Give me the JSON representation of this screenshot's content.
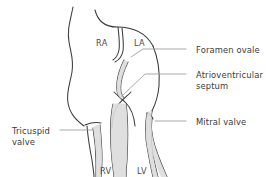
{
  "figure": {
    "kind": "anatomical-line-diagram",
    "background_color": "#ffffff",
    "stroke_color": "#3c3c3c",
    "leader_color": "#9a9a9a",
    "fill_color": "#dcdcdc",
    "text_color": "#3a3a3a"
  },
  "chambers": [
    {
      "id": "ra",
      "label": "RA",
      "meaning": "right atrium",
      "x": 96,
      "y": 38
    },
    {
      "id": "la",
      "label": "LA",
      "meaning": "left atrium",
      "x": 134,
      "y": 38
    },
    {
      "id": "rv",
      "label": "RV",
      "meaning": "right ventricle",
      "x": 100,
      "y": 166
    },
    {
      "id": "lv",
      "label": "LV",
      "meaning": "left ventricle",
      "x": 137,
      "y": 166
    }
  ],
  "callouts": [
    {
      "id": "foramen-ovale",
      "label": "Foramen ovale",
      "side": "right",
      "text_x": 196,
      "text_y": 45,
      "leader": {
        "x1": 186,
        "y1": 49,
        "x2": 143,
        "y2": 49,
        "x3": 131,
        "y3": 57
      }
    },
    {
      "id": "atrioventricular-septum",
      "label": "Atrioventricular\nseptum",
      "side": "right",
      "text_x": 196,
      "text_y": 70,
      "leader": {
        "x1": 186,
        "y1": 74,
        "x2": 145,
        "y2": 74,
        "x3": 122,
        "y3": 96
      }
    },
    {
      "id": "mitral-valve",
      "label": "Mitral valve",
      "side": "right",
      "text_x": 196,
      "text_y": 117,
      "leader": {
        "x1": 186,
        "y1": 121,
        "x2": 155,
        "y2": 121
      }
    },
    {
      "id": "tricuspid-valve",
      "label": "Tricuspid\nvalve",
      "side": "left",
      "text_x": 12,
      "text_y": 126,
      "leader": {
        "x1": 60,
        "y1": 130,
        "x2": 93,
        "y2": 130
      }
    }
  ],
  "structures": [
    {
      "id": "rv-free-wall",
      "name": "right ventricular free wall (left outline)"
    },
    {
      "id": "lv-free-wall",
      "name": "left ventricular free wall (right outline)"
    },
    {
      "id": "atrial-roof",
      "name": "atrial roof"
    },
    {
      "id": "septum-secundum",
      "name": "septum secundum"
    },
    {
      "id": "septum-primum-flap",
      "name": "septum primum flap valve of foramen ovale"
    },
    {
      "id": "av-septum-crux",
      "name": "atrioventricular septum / crux"
    },
    {
      "id": "tricuspid-leaflets",
      "name": "tricuspid valve leaflets"
    },
    {
      "id": "mitral-leaflets",
      "name": "mitral valve leaflets"
    },
    {
      "id": "ventricular-septum",
      "name": "interventricular septum"
    }
  ]
}
